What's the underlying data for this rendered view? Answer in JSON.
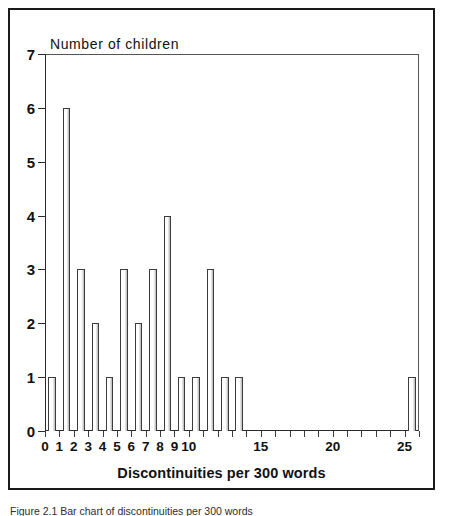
{
  "figure": {
    "caption": "Figure 2.1  Bar chart of discontinuities per 300 words"
  },
  "chart_data": {
    "type": "bar",
    "title": "Number of children",
    "xlabel": "Discontinuities per 300 words",
    "ylabel": "Number of children",
    "categories": [
      0,
      1,
      2,
      3,
      4,
      5,
      6,
      7,
      8,
      9,
      10,
      11,
      12,
      13,
      14,
      15,
      16,
      17,
      18,
      19,
      20,
      21,
      22,
      23,
      24,
      25
    ],
    "values": [
      1,
      6,
      3,
      2,
      1,
      3,
      2,
      3,
      4,
      1,
      1,
      3,
      1,
      1,
      0,
      0,
      0,
      0,
      0,
      0,
      0,
      0,
      0,
      0,
      0,
      1
    ],
    "xlim": [
      0,
      26
    ],
    "ylim": [
      0,
      7
    ],
    "ytick_labels": [
      "0",
      "1",
      "2",
      "3",
      "4",
      "5",
      "6",
      "7"
    ],
    "ytick_values": [
      0,
      1,
      2,
      3,
      4,
      5,
      6,
      7
    ],
    "xtick_values": [
      0,
      1,
      2,
      3,
      4,
      5,
      6,
      7,
      8,
      9,
      10,
      11,
      12,
      13,
      14,
      15,
      16,
      17,
      18,
      19,
      20,
      21,
      22,
      23,
      24,
      25,
      26
    ],
    "xtick_labeled": [
      {
        "value": 0,
        "label": "0"
      },
      {
        "value": 1,
        "label": "1"
      },
      {
        "value": 2,
        "label": "2"
      },
      {
        "value": 3,
        "label": "3"
      },
      {
        "value": 4,
        "label": "4"
      },
      {
        "value": 5,
        "label": "5"
      },
      {
        "value": 6,
        "label": "6"
      },
      {
        "value": 7,
        "label": "7"
      },
      {
        "value": 8,
        "label": "8"
      },
      {
        "value": 9,
        "label": "9"
      },
      {
        "value": 10,
        "label": "10"
      },
      {
        "value": 15,
        "label": "15"
      },
      {
        "value": 20,
        "label": "20"
      },
      {
        "value": 25,
        "label": "25"
      }
    ],
    "grid": false,
    "legend": null,
    "bar_color": "#ffffff",
    "bar_edge_color": "#3c3c3c",
    "axis_color": "#2b2b2b"
  }
}
